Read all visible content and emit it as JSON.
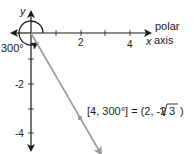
{
  "diagram": {
    "axes": {
      "y_label": "y",
      "x_label": "x",
      "polar_axis_label_line1": "polar",
      "polar_axis_label_line2": "axis",
      "x_ticks": [
        "2",
        "4"
      ],
      "y_ticks": [
        "-2",
        "-4"
      ]
    },
    "angle_label": "300°",
    "equation": "[4, 300°] = (2, -2√3 )",
    "equation_parts": {
      "left": "[4, 300°] = (2, -2",
      "sqrt_arg": "3",
      "close": ")"
    },
    "point": {
      "r": 4,
      "theta_deg": 300,
      "x": 2,
      "y": "-2√3"
    },
    "colors": {
      "axis": "#1a1a1a",
      "ray": "#999999",
      "point": "#999999"
    }
  }
}
